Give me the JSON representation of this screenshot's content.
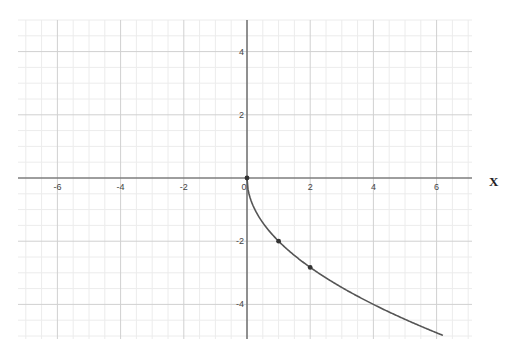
{
  "chart_data": {
    "type": "line",
    "title": "",
    "xlabel": "X",
    "ylabel": "",
    "function": "y = -2*sqrt(x)",
    "xlim": [
      -7.25,
      7.1
    ],
    "ylim": [
      -5.1,
      5.0
    ],
    "grid": true,
    "minor_grid_step": 0.5,
    "x_ticks": [
      -6,
      -4,
      -2,
      0,
      2,
      4,
      6
    ],
    "y_ticks": [
      4,
      2,
      -2,
      -4
    ],
    "series": [
      {
        "name": "y = -2√x",
        "color": "#555555",
        "x": [
          0,
          0.25,
          0.5,
          1,
          1.5,
          2,
          3,
          4,
          5,
          6,
          6.2
        ],
        "y": [
          0,
          -1,
          -1.41,
          -2,
          -2.45,
          -2.83,
          -3.46,
          -4,
          -4.47,
          -4.9,
          -4.98
        ]
      }
    ],
    "points": [
      {
        "x": 0,
        "y": 0
      },
      {
        "x": 1,
        "y": -2
      },
      {
        "x": 2,
        "y": -2.83
      }
    ]
  }
}
